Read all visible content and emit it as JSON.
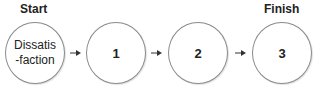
{
  "diagram": {
    "start_label": "Start",
    "finish_label": "Finish",
    "nodes": [
      {
        "label": "Dissatis\n-faction"
      },
      {
        "label": "1"
      },
      {
        "label": "2"
      },
      {
        "label": "3"
      }
    ],
    "colors": {
      "node_border": "#8a8a8a",
      "text": "#222222",
      "arrow": "#333333"
    }
  }
}
